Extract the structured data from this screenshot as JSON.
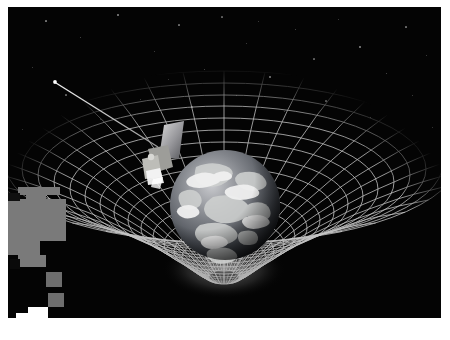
{
  "figure": {
    "background_color": "#040404",
    "page_background_color": "#ffffff",
    "grid_color": "#c8c8c8",
    "inner_grid_color": "#b4b4b4",
    "star_color": "#cfcfcf",
    "earth": {
      "label": "earth",
      "ocean_color": "#4a4f56",
      "land_color": "#8d8d8a",
      "cloud_color": "#e6e6e6",
      "shadow_color": "#0a0a0c"
    },
    "satellite": {
      "label": "gravity-probe-b-satellite",
      "body_color": "#a9a9a4",
      "panel_color": "#8e8e92",
      "highlight_color": "#f2f2f2",
      "boom_color": "#d6d6d6",
      "boom_tip_color": "#ffffff"
    },
    "artifacts": [
      {
        "name": "occlusion-block-1",
        "x": 10,
        "y": 180,
        "w": 42,
        "h": 8,
        "color": "#7a7a7a"
      },
      {
        "name": "occlusion-block-2",
        "x": 18,
        "y": 188,
        "w": 20,
        "h": 10,
        "color": "#7a7a7a"
      },
      {
        "name": "occlusion-block-3",
        "x": 0,
        "y": 192,
        "w": 58,
        "h": 42,
        "color": "#7a7a7a"
      },
      {
        "name": "occlusion-block-4",
        "x": 0,
        "y": 186,
        "w": 12,
        "h": 8,
        "color": "#101010"
      },
      {
        "name": "occlusion-block-5",
        "x": 0,
        "y": 234,
        "w": 32,
        "h": 14,
        "color": "#7a7a7a"
      },
      {
        "name": "occlusion-block-6",
        "x": 10,
        "y": 248,
        "w": 28,
        "h": 12,
        "color": "#7a7a7a"
      },
      {
        "name": "occlusion-block-7",
        "x": 38,
        "y": 265,
        "w": 16,
        "h": 15,
        "color": "#6e6e6e"
      },
      {
        "name": "occlusion-block-8",
        "x": 40,
        "y": 286,
        "w": 16,
        "h": 14,
        "color": "#6e6e6e"
      },
      {
        "name": "occlusion-block-9",
        "x": 20,
        "y": 300,
        "w": 20,
        "h": 11,
        "color": "#ffffff"
      },
      {
        "name": "occlusion-block-10",
        "x": 8,
        "y": 306,
        "w": 14,
        "h": 5,
        "color": "#ffffff"
      },
      {
        "name": "occlusion-block-11",
        "x": 2,
        "y": 252,
        "w": 10,
        "h": 10,
        "color": "#0a0a0a"
      }
    ],
    "stars": [
      {
        "x": 38,
        "y": 14,
        "r": 0.6,
        "o": 0.55
      },
      {
        "x": 72,
        "y": 30,
        "r": 0.5,
        "o": 0.4
      },
      {
        "x": 110,
        "y": 8,
        "r": 0.7,
        "o": 0.6
      },
      {
        "x": 146,
        "y": 44,
        "r": 0.5,
        "o": 0.35
      },
      {
        "x": 171,
        "y": 18,
        "r": 0.6,
        "o": 0.5
      },
      {
        "x": 196,
        "y": 62,
        "r": 0.5,
        "o": 0.4
      },
      {
        "x": 214,
        "y": 10,
        "r": 0.6,
        "o": 0.45
      },
      {
        "x": 238,
        "y": 36,
        "r": 0.5,
        "o": 0.35
      },
      {
        "x": 262,
        "y": 70,
        "r": 0.7,
        "o": 0.55
      },
      {
        "x": 287,
        "y": 22,
        "r": 0.5,
        "o": 0.4
      },
      {
        "x": 306,
        "y": 52,
        "r": 0.6,
        "o": 0.45
      },
      {
        "x": 330,
        "y": 12,
        "r": 0.5,
        "o": 0.35
      },
      {
        "x": 352,
        "y": 40,
        "r": 0.7,
        "o": 0.6
      },
      {
        "x": 378,
        "y": 66,
        "r": 0.5,
        "o": 0.4
      },
      {
        "x": 398,
        "y": 20,
        "r": 0.6,
        "o": 0.5
      },
      {
        "x": 418,
        "y": 48,
        "r": 0.5,
        "o": 0.35
      },
      {
        "x": 24,
        "y": 60,
        "r": 0.5,
        "o": 0.35
      },
      {
        "x": 58,
        "y": 88,
        "r": 0.6,
        "o": 0.45
      },
      {
        "x": 92,
        "y": 112,
        "r": 0.5,
        "o": 0.3
      },
      {
        "x": 132,
        "y": 92,
        "r": 0.5,
        "o": 0.35
      },
      {
        "x": 184,
        "y": 100,
        "r": 0.6,
        "o": 0.4
      },
      {
        "x": 228,
        "y": 88,
        "r": 0.5,
        "o": 0.3
      },
      {
        "x": 276,
        "y": 104,
        "r": 0.5,
        "o": 0.35
      },
      {
        "x": 318,
        "y": 94,
        "r": 0.6,
        "o": 0.4
      },
      {
        "x": 362,
        "y": 110,
        "r": 0.5,
        "o": 0.3
      },
      {
        "x": 404,
        "y": 88,
        "r": 0.5,
        "o": 0.35
      },
      {
        "x": 424,
        "y": 120,
        "r": 0.5,
        "o": 0.3
      },
      {
        "x": 14,
        "y": 122,
        "r": 0.5,
        "o": 0.3
      },
      {
        "x": 250,
        "y": 14,
        "r": 0.5,
        "o": 0.35
      },
      {
        "x": 160,
        "y": 72,
        "r": 0.5,
        "o": 0.3
      }
    ]
  }
}
